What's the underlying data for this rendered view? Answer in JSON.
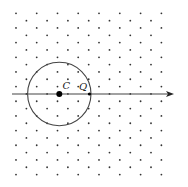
{
  "diagram": {
    "type": "triangular-lattice-with-circle",
    "colors": {
      "background": "#ffffff",
      "dot": "#333333",
      "line": "#444444",
      "circle": "#444444",
      "center": "#000000"
    },
    "lattice": {
      "rows": 23,
      "row_y0": 13.3,
      "row_dy": 7.33,
      "even_row_x": [
        16,
        36.7,
        57.5,
        78.2,
        99,
        119.8,
        140.6,
        161.4
      ],
      "odd_row_x": [
        26.4,
        47.1,
        67.9,
        88.7,
        109.5,
        130.3,
        151
      ],
      "dot_radius": 0.9
    },
    "axis": {
      "x_start": 12,
      "x_end": 174,
      "y": 94,
      "arrowhead": true
    },
    "circle": {
      "cx": 59.3,
      "cy": 94,
      "r": 31.7
    },
    "points": [
      {
        "label": "C",
        "x": 59.3,
        "y": 94,
        "r": 3,
        "label_x": 62.5,
        "label_y": 89
      },
      {
        "label": "Q",
        "x": 89.5,
        "y": 94,
        "r": 1.6,
        "label_x": 79,
        "label_y": 90
      }
    ]
  }
}
